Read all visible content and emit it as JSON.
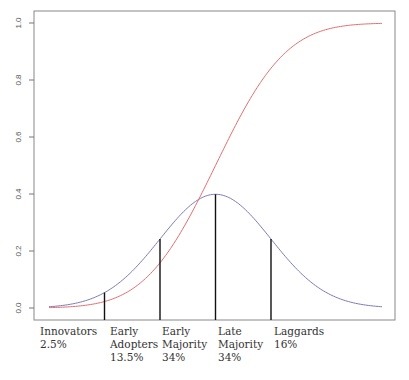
{
  "chart_data": {
    "type": "line",
    "title": "",
    "xlabel": "",
    "ylabel": "",
    "xlim": [
      -3,
      3
    ],
    "ylim": [
      0,
      1
    ],
    "yticks": [
      0.0,
      0.2,
      0.4,
      0.6,
      0.8,
      1.0
    ],
    "ytick_labels": [
      "0.0",
      "0.2",
      "0.4",
      "0.6",
      "0.8",
      "1.0"
    ],
    "xticks": [],
    "grid": false,
    "legend": "none",
    "series": [
      {
        "name": "adoption density (normal pdf)",
        "color": "#7c7cb8",
        "function": "normal_pdf",
        "mean": 0,
        "sd": 1,
        "x": [
          -3,
          -2.5,
          -2,
          -1.5,
          -1,
          -0.5,
          0,
          0.5,
          1,
          1.5,
          2,
          2.5,
          3
        ],
        "y": [
          0.004,
          0.018,
          0.054,
          0.13,
          0.242,
          0.352,
          0.399,
          0.352,
          0.242,
          0.13,
          0.054,
          0.018,
          0.004
        ]
      },
      {
        "name": "cumulative adoption (normal cdf)",
        "color": "#e07070",
        "function": "normal_cdf",
        "mean": 0,
        "sd": 1,
        "x": [
          -3,
          -2.5,
          -2,
          -1.5,
          -1,
          -0.5,
          0,
          0.5,
          1,
          1.5,
          2,
          2.5,
          3
        ],
        "y": [
          0.001,
          0.006,
          0.023,
          0.067,
          0.159,
          0.309,
          0.5,
          0.691,
          0.841,
          0.933,
          0.977,
          0.994,
          0.999
        ]
      }
    ],
    "dividers": [
      {
        "x": -2,
        "height": 0.054
      },
      {
        "x": -1,
        "height": 0.242
      },
      {
        "x": 0,
        "height": 0.399
      },
      {
        "x": 1,
        "height": 0.242
      }
    ],
    "categories": [
      {
        "lines": [
          "Innovators",
          "2.5%"
        ],
        "x_start": -3,
        "percent": 2.5
      },
      {
        "lines": [
          "Early",
          "Adopters",
          "13.5%"
        ],
        "x_start": -2,
        "percent": 13.5
      },
      {
        "lines": [
          "Early",
          "Majority",
          "34%"
        ],
        "x_start": -1,
        "percent": 34
      },
      {
        "lines": [
          "Late",
          "Majority",
          "34%"
        ],
        "x_start": 0,
        "percent": 34
      },
      {
        "lines": [
          "Laggards",
          "16%"
        ],
        "x_start": 1,
        "percent": 16
      }
    ]
  }
}
